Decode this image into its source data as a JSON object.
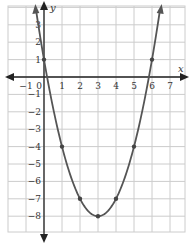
{
  "chart_data": {
    "type": "line",
    "title": "",
    "xlabel": "x",
    "ylabel": "y",
    "xlim": [
      -2,
      7.8
    ],
    "ylim": [
      -8.8,
      4
    ],
    "grid": true,
    "x_ticks": [
      -1,
      0,
      1,
      2,
      3,
      4,
      5,
      6,
      7
    ],
    "y_ticks": [
      3,
      2,
      1,
      -1,
      -2,
      -3,
      -4,
      -5,
      -6,
      -7,
      -8
    ],
    "x_tick_labels": [
      "−1",
      "0",
      "1",
      "2",
      "3",
      "4",
      "5",
      "6",
      "7"
    ],
    "y_tick_labels": [
      "3",
      "2",
      "1",
      "−1",
      "−2",
      "−3",
      "−4",
      "−5",
      "−6",
      "−7",
      "−8"
    ],
    "function": "y = (x - 3)^2 - 8",
    "series": [
      {
        "name": "parabola",
        "points": [
          [
            0,
            1
          ],
          [
            1,
            -4
          ],
          [
            2,
            -7
          ],
          [
            3,
            -8
          ],
          [
            4,
            -7
          ],
          [
            5,
            -4
          ],
          [
            6,
            1
          ]
        ],
        "color": "#555555"
      }
    ],
    "colors": {
      "curve": "#555555",
      "axis": "#222222",
      "grid": "#cccccc"
    }
  }
}
